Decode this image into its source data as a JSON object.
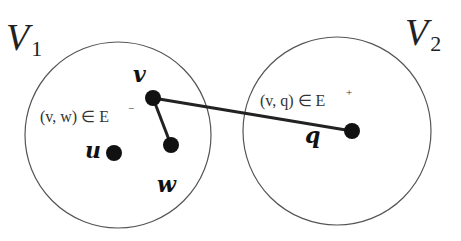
{
  "sets": [
    {
      "name": "V",
      "subscript": "1",
      "cx": 118,
      "cy": 135,
      "r": 93,
      "label_x": 6,
      "label_y": 50
    },
    {
      "name": "V",
      "subscript": "2",
      "cx": 337,
      "cy": 131,
      "r": 94,
      "label_x": 405,
      "label_y": 45
    }
  ],
  "nodes": [
    {
      "id": "v",
      "label": "v",
      "x": 153,
      "y": 98,
      "label_x": 133,
      "label_y": 82
    },
    {
      "id": "w",
      "label": "w",
      "x": 171,
      "y": 145,
      "label_x": 157,
      "label_y": 192
    },
    {
      "id": "u",
      "label": "u",
      "x": 114,
      "y": 153,
      "label_x": 85,
      "label_y": 158
    },
    {
      "id": "q",
      "label": "q",
      "x": 352,
      "y": 131,
      "label_x": 305,
      "label_y": 143
    }
  ],
  "edges": [
    {
      "from": "v",
      "to": "w",
      "label": "(v, w) ∈ E",
      "sup": "−",
      "label_x": 40,
      "label_y": 122,
      "sup_x": 128,
      "sup_y": 112,
      "type": "negative"
    },
    {
      "from": "v",
      "to": "q",
      "label": "(v, q) ∈ E",
      "sup": "+",
      "label_x": 260,
      "label_y": 106,
      "sup_x": 346,
      "sup_y": 96,
      "type": "positive"
    }
  ],
  "colors": {
    "circle_stroke": "#555555",
    "edge": "#222222",
    "node": "#111111",
    "background": "#ffffff"
  }
}
